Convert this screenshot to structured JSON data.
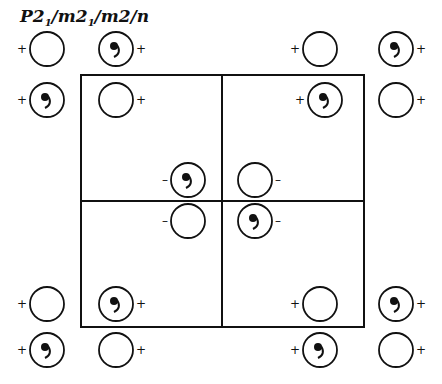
{
  "title": {
    "main": "P2",
    "parts": [
      "P2",
      "1",
      "/m2",
      "1",
      "/m2/n"
    ]
  },
  "cell": {
    "x0": 81,
    "y0": 75,
    "x1": 364,
    "y1": 327,
    "xm": 222,
    "ym": 201
  },
  "symbol_radius": 17,
  "symbols": [
    {
      "x": 47,
      "y": 49,
      "comma": false,
      "sign": "+"
    },
    {
      "x": 116,
      "y": 49,
      "comma": true,
      "sign": "+"
    },
    {
      "x": 320,
      "y": 49,
      "comma": false,
      "sign": "+"
    },
    {
      "x": 396,
      "y": 49,
      "comma": true,
      "sign": "+"
    },
    {
      "x": 47,
      "y": 100,
      "comma": true,
      "sign": "+"
    },
    {
      "x": 116,
      "y": 100,
      "comma": false,
      "sign": "+"
    },
    {
      "x": 325,
      "y": 100,
      "comma": true,
      "sign": "+"
    },
    {
      "x": 396,
      "y": 100,
      "comma": false,
      "sign": "+"
    },
    {
      "x": 188,
      "y": 180,
      "comma": true,
      "sign": "-"
    },
    {
      "x": 255,
      "y": 180,
      "comma": false,
      "sign": "-"
    },
    {
      "x": 188,
      "y": 221,
      "comma": false,
      "sign": "-"
    },
    {
      "x": 255,
      "y": 221,
      "comma": true,
      "sign": "-"
    },
    {
      "x": 47,
      "y": 304,
      "comma": false,
      "sign": "+"
    },
    {
      "x": 116,
      "y": 304,
      "comma": true,
      "sign": "+"
    },
    {
      "x": 320,
      "y": 304,
      "comma": false,
      "sign": "+"
    },
    {
      "x": 396,
      "y": 304,
      "comma": true,
      "sign": "+"
    },
    {
      "x": 47,
      "y": 350,
      "comma": true,
      "sign": "+"
    },
    {
      "x": 116,
      "y": 350,
      "comma": false,
      "sign": "+"
    },
    {
      "x": 320,
      "y": 350,
      "comma": true,
      "sign": "+"
    },
    {
      "x": 396,
      "y": 350,
      "comma": false,
      "sign": "+"
    }
  ],
  "sign_side": {
    "left_of": [
      0,
      4,
      8,
      10,
      12,
      16,
      2,
      6,
      14,
      18
    ],
    "right_default": true
  }
}
